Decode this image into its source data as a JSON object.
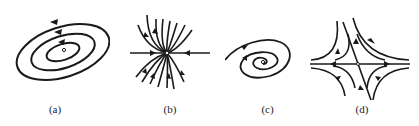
{
  "figure": {
    "panels": [
      {
        "id": "a",
        "label": "(a)",
        "type": "center",
        "description": "concentric closed elliptical orbits with arrows"
      },
      {
        "id": "b",
        "label": "(b)",
        "type": "node",
        "description": "trajectories converging into a node"
      },
      {
        "id": "c",
        "label": "(c)",
        "type": "spiral",
        "description": "trajectories spiraling inward toward focus"
      },
      {
        "id": "d",
        "label": "(d)",
        "type": "saddle",
        "description": "hyperbolic trajectories around saddle point"
      }
    ],
    "colors": {
      "stroke": "#1a1a1a",
      "background": "#ffffff"
    }
  }
}
